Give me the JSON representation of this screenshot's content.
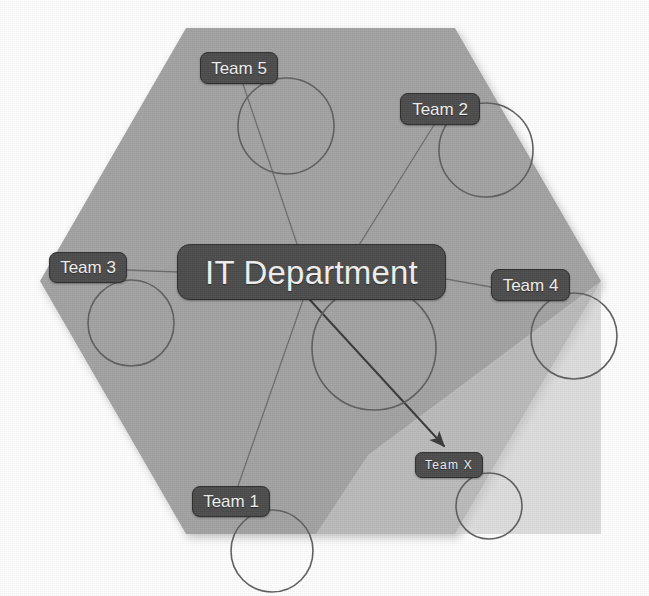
{
  "diagram": {
    "background_color": "#ffffff",
    "hexagon": {
      "name": "department-boundary-hexagon",
      "fill_color": "#a3a3a3",
      "points": "186,28 455,28 601,281 455,534 186,534 40,281"
    },
    "overlay_triangle": {
      "name": "highlight-triangle",
      "fill_color": "#c9c9c9",
      "points": "368,455 601,281 601,534 316,534"
    },
    "edge_color": "#6e6e6e",
    "arrow_color": "#3a3a3a",
    "circle_color": "#5f5f5f",
    "node_fill": "#4c4c4c",
    "node_border": "#2e2e2e",
    "node_text_color": "#f2f2f2"
  },
  "central_node": {
    "name": "it-department-node",
    "label": "IT Department",
    "x": 177,
    "y": 244,
    "width": 269,
    "height": 56
  },
  "nodes": [
    {
      "name": "team-5-node",
      "label": "Team 5",
      "x": 200,
      "y": 52,
      "width": 78,
      "height": 32,
      "circle": {
        "cx": 286,
        "cy": 126,
        "r": 48
      }
    },
    {
      "name": "team-2-node",
      "label": "Team 2",
      "x": 400,
      "y": 93,
      "width": 80,
      "height": 32,
      "circle": {
        "cx": 486,
        "cy": 150,
        "r": 47
      }
    },
    {
      "name": "team-3-node",
      "label": "Team 3",
      "x": 49,
      "y": 252,
      "width": 78,
      "height": 31,
      "circle": {
        "cx": 131,
        "cy": 323,
        "r": 43
      }
    },
    {
      "name": "team-4-node",
      "label": "Team 4",
      "x": 491,
      "y": 269,
      "width": 79,
      "height": 32,
      "circle": {
        "cx": 574,
        "cy": 336,
        "r": 43
      }
    },
    {
      "name": "team-1-node",
      "label": "Team 1",
      "x": 192,
      "y": 486,
      "width": 78,
      "height": 31,
      "circle": {
        "cx": 272,
        "cy": 551,
        "r": 41
      }
    },
    {
      "name": "team-x-node",
      "label": "Team X",
      "x": 415,
      "y": 452,
      "width": 68,
      "height": 26,
      "circle": {
        "cx": 489,
        "cy": 506,
        "r": 33
      }
    }
  ],
  "edges": [
    {
      "name": "edge-it-department-to-team-5",
      "from": "IT Department",
      "to": "Team 5",
      "x1": 297,
      "y1": 244,
      "x2": 243,
      "y2": 84,
      "arrow": false
    },
    {
      "name": "edge-it-department-to-team-2",
      "from": "IT Department",
      "to": "Team 2",
      "x1": 346,
      "y1": 266,
      "x2": 434,
      "y2": 125,
      "arrow": false
    },
    {
      "name": "edge-it-department-to-team-3",
      "from": "IT Department",
      "to": "Team 3",
      "x1": 177,
      "y1": 272,
      "x2": 127,
      "y2": 270,
      "arrow": false
    },
    {
      "name": "edge-it-department-to-team-4",
      "from": "IT Department",
      "to": "Team 4",
      "x1": 446,
      "y1": 279,
      "x2": 491,
      "y2": 287,
      "arrow": false
    },
    {
      "name": "edge-it-department-to-team-1",
      "from": "IT Department",
      "to": "Team 1",
      "x1": 303,
      "y1": 300,
      "x2": 238,
      "y2": 486,
      "arrow": false
    },
    {
      "name": "edge-it-department-to-team-x",
      "from": "IT Department",
      "to": "Team X",
      "x1": 310,
      "y1": 300,
      "x2": 444,
      "y2": 446,
      "arrow": true
    }
  ],
  "large_circle": {
    "name": "central-annotation-circle",
    "cx": 374,
    "cy": 348,
    "r": 62
  }
}
